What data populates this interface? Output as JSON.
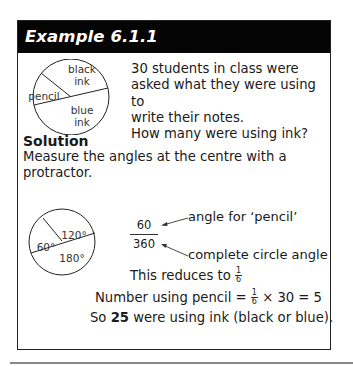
{
  "header": {
    "title": "Example 6.1.1"
  },
  "question": {
    "lines": [
      "30 students in class were",
      "asked what they were using to",
      "write their notes.",
      "How many were using ink?"
    ]
  },
  "pie_diagram": {
    "labels": {
      "black": "black",
      "black2": "ink",
      "pencil": "pencil",
      "blue": "blue",
      "blue2": "ink"
    }
  },
  "solution": {
    "title": "Solution",
    "text_lines": [
      "Measure the angles at the centre with a",
      "protractor."
    ],
    "angle_diagram": {
      "a1": "120°",
      "a2": "60°",
      "a3": "180°"
    },
    "fraction": {
      "numerator": "60",
      "denominator": "360"
    },
    "annotations": {
      "numerator_note": "angle for ‘pencil’",
      "denominator_note": "complete circle angle"
    },
    "reduce_text": "This reduces to",
    "reduce_frac": {
      "n": "1",
      "d": "6"
    },
    "calc_prefix": "Number using pencil =",
    "calc_frac": {
      "n": "1",
      "d": "6"
    },
    "calc_suffix": "× 30 = 5",
    "answer_prefix": "So",
    "answer_bold": "25",
    "answer_suffix": "were using ink (black or blue)."
  },
  "colors": {
    "header_bg": "#050505",
    "header_text": "#ffffff",
    "border": "#222222",
    "rule": "#888888"
  }
}
